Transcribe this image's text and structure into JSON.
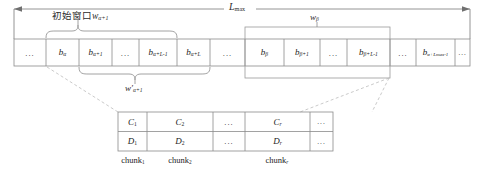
{
  "figure": {
    "title_top": "L_max",
    "top_axis_label": "Lmax",
    "initial_window_label": "初始窗口",
    "initial_window_sub": "w",
    "labels": {
      "Lmax_base": "L",
      "Lmax_sub": "max",
      "w_alpha_base": "w",
      "w_alpha_sub": "α+1",
      "w_beta_base": "w",
      "w_beta_sub": "β",
      "w_prime_base": "w",
      "w_prime_mark": "′",
      "w_prime_sub": "α+1"
    },
    "strip_cells": [
      {
        "id": "c0",
        "base": "",
        "sub": "",
        "dots": true,
        "text": "..."
      },
      {
        "id": "c1",
        "base": "b",
        "sub": "α",
        "dots": false,
        "text": "b α"
      },
      {
        "id": "c2",
        "base": "b",
        "sub": "α+1",
        "dots": false,
        "text": "b α+1"
      },
      {
        "id": "c3",
        "base": "",
        "sub": "",
        "dots": true,
        "text": "..."
      },
      {
        "id": "c4",
        "base": "b",
        "sub": "α+L-1",
        "dots": false,
        "text": "b α+L-1"
      },
      {
        "id": "c5",
        "base": "b",
        "sub": "α+L",
        "dots": false,
        "text": "b α+L"
      },
      {
        "id": "c6",
        "base": "",
        "sub": "",
        "dots": true,
        "text": "..."
      },
      {
        "id": "c7",
        "base": "b",
        "sub": "β",
        "dots": false,
        "text": "b β"
      },
      {
        "id": "c8",
        "base": "b",
        "sub": "β+1",
        "dots": false,
        "text": "b β+1"
      },
      {
        "id": "c9",
        "base": "",
        "sub": "",
        "dots": true,
        "text": "..."
      },
      {
        "id": "c10",
        "base": "b",
        "sub": "β+L-1",
        "dots": false,
        "text": "b β+L-1"
      },
      {
        "id": "c11",
        "base": "",
        "sub": "",
        "dots": true,
        "text": "..."
      },
      {
        "id": "c12",
        "base": "b",
        "sub": "α+Lmax-1",
        "dots": false,
        "text": "b α+Lmax-1"
      },
      {
        "id": "c13",
        "base": "",
        "sub": "",
        "dots": true,
        "text": "..."
      }
    ],
    "table": {
      "row_c": [
        {
          "base": "C",
          "sub": "1",
          "dots": false
        },
        {
          "base": "C",
          "sub": "2",
          "dots": false
        },
        {
          "base": "",
          "sub": "",
          "dots": true
        },
        {
          "base": "C",
          "sub": "r",
          "dots": false
        },
        {
          "base": "",
          "sub": "",
          "dots": true
        }
      ],
      "row_d": [
        {
          "base": "D",
          "sub": "1",
          "dots": false
        },
        {
          "base": "D",
          "sub": "2",
          "dots": false
        },
        {
          "base": "",
          "sub": "",
          "dots": true
        },
        {
          "base": "D",
          "sub": "r",
          "dots": false
        },
        {
          "base": "",
          "sub": "",
          "dots": true
        }
      ],
      "chunk_labels": [
        {
          "base": "chunk",
          "sub": "1"
        },
        {
          "base": "chunk",
          "sub": "2"
        },
        {
          "base": "chunk",
          "sub": "r"
        }
      ]
    },
    "colors": {
      "line": "#7a7a7a",
      "cell_border": "#8a8a8a",
      "text": "#222222",
      "dashed": "#b8b8b8",
      "background": "#ffffff"
    }
  }
}
